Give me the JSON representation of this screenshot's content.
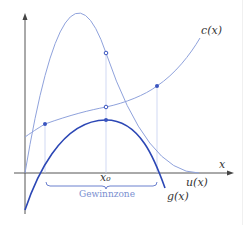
{
  "diagram": {
    "labels": {
      "c": "c(x)",
      "u": "u(x)",
      "g": "g(x)",
      "x_axis": "x",
      "x0": "x₀",
      "zone": "Gewinnzone"
    },
    "colors": {
      "light_curve": "#8fa2dc",
      "dark_curve": "#2c47b5",
      "axis": "#555555",
      "guide": "#c5cff0",
      "point": "#3a55c0"
    }
  }
}
